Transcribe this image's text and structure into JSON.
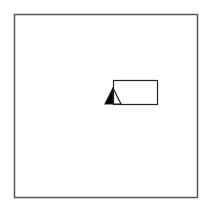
{
  "diagram": {
    "frame": {
      "x": 14,
      "y": 14,
      "width": 183,
      "height": 183,
      "stroke": "#555555"
    },
    "rectangle": {
      "x": 113,
      "y": 80,
      "width": 44,
      "height": 24,
      "stroke": "#222222"
    },
    "triangle_marker": {
      "apex": [
        113,
        88
      ],
      "base_left": [
        105,
        104
      ],
      "base_right": [
        121,
        104
      ],
      "fill_half": "left",
      "fill_color": "#000000",
      "stroke": "#222222"
    }
  }
}
